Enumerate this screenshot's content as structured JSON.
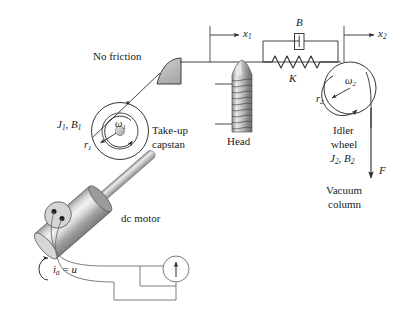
{
  "figure": {
    "background_color": "#ffffff",
    "line_color": "#2b2b2b",
    "fill_gray": "#b7b7b7"
  },
  "labels": {
    "no_friction": "No friction",
    "take_up": "Take-up",
    "capstan": "capstan",
    "dc_motor": "dc motor",
    "head": "Head",
    "idler": "Idler",
    "wheel": "wheel",
    "vacuum": "Vacuum",
    "column": "column",
    "damper_B": "B",
    "spring_K": "K",
    "force_F": "F"
  },
  "symbols": {
    "omega1": {
      "base": "ω",
      "sub": "1"
    },
    "omega2": {
      "base": "ω",
      "sub": "2"
    },
    "r1": {
      "base": "r",
      "sub": "1"
    },
    "r2": {
      "base": "r",
      "sub": "2"
    },
    "x1": {
      "base": "x",
      "sub": "1"
    },
    "x2": {
      "base": "x",
      "sub": "2"
    },
    "J1B1_J": "J",
    "J1B1_J_sub": "1",
    "J1B1_B": "B",
    "J1B1_B_sub": "1",
    "J2B2_J": "J",
    "J2B2_J_sub": "2",
    "J2B2_B": "B",
    "J2B2_B_sub": "2",
    "current": {
      "base": "i",
      "sub": "a",
      "eq": " = ",
      "value": "u"
    },
    "comma": ", "
  },
  "components": [
    {
      "name": "take-up-capstan",
      "label": "Take-up capstan",
      "inertia": "J1",
      "damping": "B1",
      "radius": "r1",
      "speed": "omega1"
    },
    {
      "name": "idler-wheel",
      "label": "Idler wheel",
      "inertia": "J2",
      "damping": "B2",
      "radius": "r2",
      "speed": "omega2"
    },
    {
      "name": "dc-motor",
      "label": "dc motor",
      "input": "ia = u"
    },
    {
      "name": "head",
      "label": "Head"
    },
    {
      "name": "vacuum-column",
      "label": "Vacuum column",
      "force": "F"
    },
    {
      "name": "spring",
      "label": "K"
    },
    {
      "name": "damper",
      "label": "B"
    },
    {
      "name": "frictionless-guide",
      "label": "No friction"
    }
  ]
}
